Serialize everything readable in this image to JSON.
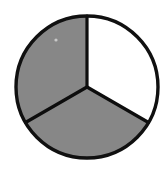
{
  "figure": {
    "background_color": "#ffffff",
    "width": 164,
    "height": 172
  },
  "chart_data": {
    "type": "pie",
    "title": "",
    "subtitle": "",
    "xlabel": "",
    "ylabel": "",
    "legend_position": "none",
    "grid": false,
    "center_x": 87,
    "center_y": 87,
    "radius": 71,
    "outline_color": "#101010",
    "outline_width": 3.2,
    "categories": [
      "Sector 1",
      "Sector 2",
      "Sector 3"
    ],
    "values": [
      33.3333,
      33.3333,
      33.3333
    ],
    "labels": [
      "",
      "",
      ""
    ],
    "slices": [
      {
        "name": "top-right-sector",
        "value": 33.3333,
        "fraction": 0.333333,
        "angle_degrees": 120,
        "start_angle_degrees": -90,
        "end_angle_degrees": 30,
        "fill": "#ffffff",
        "filled": false,
        "shade": "white"
      },
      {
        "name": "bottom-sector",
        "value": 33.3333,
        "fraction": 0.333333,
        "angle_degrees": 120,
        "start_angle_degrees": 30,
        "end_angle_degrees": 150,
        "fill": "#878787",
        "filled": true,
        "shade": "gray"
      },
      {
        "name": "upper-left-sector",
        "value": 33.3333,
        "fraction": 0.333333,
        "angle_degrees": 120,
        "start_angle_degrees": 150,
        "end_angle_degrees": 270,
        "fill": "#878787",
        "filled": true,
        "shade": "gray"
      }
    ],
    "radii": [
      {
        "name": "radius-up",
        "angle_degrees": -90,
        "x1": 87,
        "y1": 87,
        "x2": 87,
        "y2": 16
      },
      {
        "name": "radius-lower-right",
        "angle_degrees": 30,
        "x1": 87,
        "y1": 87,
        "x2": 148.5,
        "y2": 122.5
      },
      {
        "name": "radius-lower-left",
        "angle_degrees": 150,
        "x1": 87,
        "y1": 87,
        "x2": 25.5,
        "y2": 122.5
      }
    ],
    "artifact": {
      "name": "light-speck",
      "x": 56,
      "y": 40,
      "radius": 1.6,
      "color": "#c9c9c9"
    }
  }
}
